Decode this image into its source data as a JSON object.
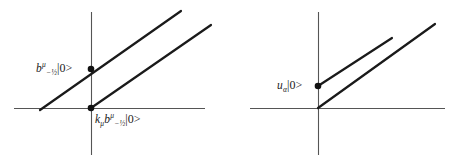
{
  "figure": {
    "type": "diagram",
    "background_color": "#ffffff",
    "line_color": "#1a1a1a",
    "axis_color": "#555555"
  },
  "panels": [
    {
      "id": "left",
      "name": "left-panel",
      "axes": {
        "x_axis": {
          "x1": 14,
          "y1": 108,
          "x2": 205,
          "y2": 108
        },
        "y_axis": {
          "x1": 91,
          "y1": 12,
          "x2": 91,
          "y2": 155
        }
      },
      "lines": [
        {
          "name": "upper-diagonal",
          "x1": 40,
          "y1": 110,
          "x2": 181,
          "y2": 11
        },
        {
          "name": "lower-diagonal",
          "x1": 91,
          "y1": 108,
          "x2": 211,
          "y2": 25
        }
      ],
      "points": [
        {
          "name": "point-b-state",
          "x": 91,
          "y": 69,
          "r": 3.2
        },
        {
          "name": "point-kb-state",
          "x": 91,
          "y": 108,
          "r": 3.2
        }
      ],
      "labels": {
        "upper": {
          "name": "label-b-state",
          "operator": "b",
          "superscript": "μ",
          "subscript": "−½",
          "ket": "|0>",
          "plain": "b^μ_{-1/2}|0>"
        },
        "lower": {
          "name": "label-kb-state",
          "prefix_operator": "k",
          "prefix_subscript": "μ",
          "operator": "b",
          "superscript": "μ",
          "subscript": "−½",
          "ket": "|0>",
          "plain": "k_μ b^μ_{-1/2}|0>"
        }
      }
    },
    {
      "id": "right",
      "name": "right-panel",
      "axes": {
        "x_axis": {
          "x1": 250,
          "y1": 108,
          "x2": 445,
          "y2": 108
        },
        "y_axis": {
          "x1": 318,
          "y1": 12,
          "x2": 318,
          "y2": 155
        }
      },
      "lines": [
        {
          "name": "upper-diagonal",
          "x1": 318,
          "y1": 86,
          "x2": 392,
          "y2": 38
        },
        {
          "name": "lower-diagonal",
          "x1": 318,
          "y1": 108,
          "x2": 435,
          "y2": 24
        }
      ],
      "points": [
        {
          "name": "point-u-state",
          "x": 318,
          "y": 86,
          "r": 3.2
        }
      ],
      "labels": {
        "upper": {
          "name": "label-u-state",
          "operator": "u",
          "subscript": "α",
          "ket": "|0>",
          "plain": "u_α|0>"
        }
      }
    }
  ]
}
